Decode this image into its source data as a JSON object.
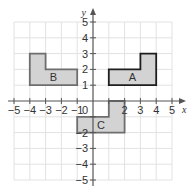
{
  "diagram": {
    "type": "coordinate-grid",
    "axes": {
      "x_label": "x",
      "y_label": "y",
      "x_range": [
        -5,
        5
      ],
      "y_range": [
        -5,
        5
      ],
      "x_ticks": [
        "−5",
        "−4",
        "−3",
        "−2",
        "−1",
        "2",
        "3",
        "4",
        "5"
      ],
      "y_ticks": [
        "5",
        "4",
        "3",
        "2",
        "1",
        "−2",
        "−3",
        "−4",
        "−5"
      ],
      "origin_label": "0"
    },
    "shapes": [
      {
        "name": "A",
        "label": "A",
        "vertices": [
          [
            1,
            1
          ],
          [
            1,
            2
          ],
          [
            3,
            2
          ],
          [
            3,
            3
          ],
          [
            4,
            3
          ],
          [
            4,
            1
          ]
        ],
        "label_pos": [
          2.5,
          1.5
        ],
        "stroke": "#1e1e1e",
        "fill": "#d3d3d3"
      },
      {
        "name": "B",
        "label": "B",
        "vertices": [
          [
            -4,
            1
          ],
          [
            -4,
            3
          ],
          [
            -3,
            3
          ],
          [
            -3,
            2
          ],
          [
            -1,
            2
          ],
          [
            -1,
            1
          ]
        ],
        "label_pos": [
          -2.5,
          1.5
        ],
        "stroke": "#6e6e6e",
        "fill": "#d3d3d3"
      },
      {
        "name": "C",
        "label": "C",
        "vertices": [
          [
            -1,
            -1
          ],
          [
            1,
            -1
          ],
          [
            1,
            0
          ],
          [
            2,
            0
          ],
          [
            2,
            -2
          ],
          [
            -1,
            -2
          ]
        ],
        "label_pos": [
          0.5,
          -1.5
        ],
        "stroke": "#6e6e6e",
        "fill": "#d3d3d3"
      }
    ],
    "colors": {
      "grid": "#e2e2e2",
      "axis": "#555555",
      "background": "#ffffff"
    }
  }
}
